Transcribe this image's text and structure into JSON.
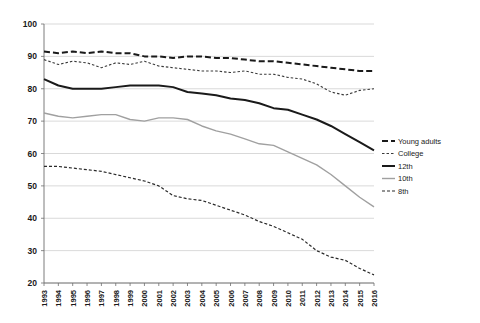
{
  "chart_data": {
    "type": "line",
    "title": "",
    "subtitle": "",
    "xlabel": "",
    "ylabel": "",
    "xlim": [
      1993,
      2016
    ],
    "ylim": [
      20,
      100
    ],
    "y_ticks": [
      20,
      30,
      40,
      50,
      60,
      70,
      80,
      90,
      100
    ],
    "grid": true,
    "legend_position": "right",
    "categories": [
      "1993",
      "1994",
      "1995",
      "1996",
      "1997",
      "1998",
      "1999",
      "2000",
      "2001",
      "2002",
      "2003",
      "2004",
      "2005",
      "2006",
      "2007",
      "2008",
      "2009",
      "2010",
      "2011",
      "2012",
      "2013",
      "2014",
      "2015",
      "2016"
    ],
    "series": [
      {
        "name": "Young adults",
        "style": "dashed",
        "color": "#1a1a1a",
        "width": 2.0,
        "dash": "6,3",
        "values": [
          91.5,
          91.0,
          91.5,
          91.0,
          91.5,
          91.0,
          91.0,
          90.0,
          90.0,
          89.5,
          90.0,
          90.0,
          89.5,
          89.5,
          89.0,
          88.5,
          88.5,
          88.0,
          87.5,
          87.0,
          86.5,
          86.0,
          85.5,
          85.5
        ]
      },
      {
        "name": "College",
        "style": "dotted",
        "color": "#3a3a3a",
        "width": 1.1,
        "dash": "2.5,2",
        "values": [
          89.0,
          87.5,
          88.5,
          88.0,
          86.5,
          88.0,
          87.5,
          88.5,
          87.0,
          86.5,
          86.0,
          85.5,
          85.5,
          85.0,
          85.5,
          84.5,
          84.5,
          83.5,
          83.0,
          81.5,
          79.0,
          78.0,
          79.5,
          80.0
        ]
      },
      {
        "name": "12th",
        "style": "solid",
        "color": "#1a1a1a",
        "width": 2.0,
        "dash": "none",
        "values": [
          83.0,
          81.0,
          80.0,
          80.0,
          80.0,
          80.5,
          81.0,
          81.0,
          81.0,
          80.5,
          79.0,
          78.5,
          78.0,
          77.0,
          76.5,
          75.5,
          74.0,
          73.5,
          72.0,
          70.5,
          68.5,
          66.0,
          63.5,
          61.0
        ]
      },
      {
        "name": "10th",
        "style": "solid",
        "color": "#a0a0a0",
        "width": 1.4,
        "dash": "none",
        "values": [
          72.5,
          71.5,
          71.0,
          71.5,
          72.0,
          72.0,
          70.5,
          70.0,
          71.0,
          71.0,
          70.5,
          68.5,
          67.0,
          66.0,
          64.5,
          63.0,
          62.5,
          60.5,
          58.5,
          56.5,
          53.5,
          50.0,
          46.5,
          43.5
        ]
      },
      {
        "name": "8th",
        "style": "dashed",
        "color": "#2a2a2a",
        "width": 1.2,
        "dash": "3,2",
        "values": [
          56.0,
          56.0,
          55.5,
          55.0,
          54.5,
          53.5,
          52.5,
          51.5,
          50.0,
          47.0,
          46.0,
          45.5,
          44.0,
          42.5,
          41.0,
          39.0,
          37.5,
          35.5,
          33.5,
          30.0,
          28.0,
          27.0,
          24.5,
          22.5
        ]
      }
    ]
  },
  "legend": {
    "items": [
      {
        "label": "Young adults"
      },
      {
        "label": "College"
      },
      {
        "label": "12th"
      },
      {
        "label": "10th"
      },
      {
        "label": "8th"
      }
    ]
  }
}
